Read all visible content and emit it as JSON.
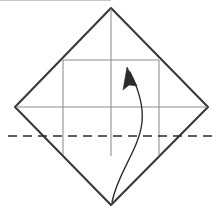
{
  "figure": {
    "background_color": "#ffffff",
    "width": 222,
    "height": 215
  },
  "colors": {
    "outline": "#3a3a3a",
    "crease": "#8c8c8c",
    "fold_dashed": "#2b2b2b",
    "arrow": "#2b2b2b"
  },
  "shapes": {
    "diamond": {
      "name": "paper-outline-diamond",
      "points": "111,8 208,107 111,205 15,107",
      "stroke_width": 2.1
    },
    "center_vertical_crease": {
      "name": "center-vertical-crease",
      "x1": 111,
      "y1": 9,
      "x2": 111,
      "y2": 156
    },
    "center_horizontal_crease": {
      "name": "center-horizontal-crease",
      "x1": 16,
      "y1": 107,
      "x2": 207,
      "y2": 107
    },
    "inner_square_top": {
      "name": "inner-square-top-crease",
      "x1": 63,
      "y1": 60,
      "x2": 159,
      "y2": 60
    },
    "inner_square_left": {
      "name": "inner-square-left-crease",
      "x1": 63,
      "y1": 60,
      "x2": 63,
      "y2": 155
    },
    "inner_square_right": {
      "name": "inner-square-right-crease",
      "x1": 159,
      "y1": 60,
      "x2": 159,
      "y2": 155
    },
    "fold_line": {
      "name": "horizontal-fold-dashed-line",
      "x1": 8,
      "y1": 136,
      "x2": 215,
      "y2": 136,
      "dash_pattern": "9 6"
    },
    "fold_arrow": {
      "name": "curved-fold-arrow",
      "path": "M 112 202 C 118 172, 139 150, 142 122 C 144 102, 136 84, 130 72",
      "head_points": "127,67 137,86 129,85 123,90"
    }
  }
}
